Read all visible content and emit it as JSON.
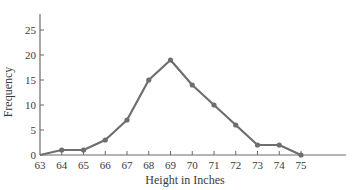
{
  "chart_data": {
    "type": "line",
    "title": "",
    "xlabel": "Height in Inches",
    "ylabel": "Frequency",
    "x": [
      63,
      64,
      65,
      66,
      67,
      68,
      69,
      70,
      71,
      72,
      73,
      74,
      75
    ],
    "series": [
      {
        "name": "Frequency",
        "values": [
          0,
          1,
          1,
          3,
          7,
          15,
          19,
          14,
          10,
          6,
          2,
          2,
          0
        ]
      }
    ],
    "x_ticks": [
      "63",
      "64",
      "65",
      "66",
      "67",
      "68",
      "69",
      "70",
      "71",
      "72",
      "73",
      "74",
      "75"
    ],
    "y_ticks": [
      "0",
      "5",
      "10",
      "15",
      "20",
      "25"
    ],
    "ylim": [
      0,
      30
    ],
    "xlim": [
      63,
      75
    ],
    "grid": false,
    "legend": null,
    "colors": {
      "line": "#6e6e6e",
      "marker": "#6e6e6e",
      "axis": "#6a6a6a",
      "text": "#3a3a3a"
    }
  }
}
